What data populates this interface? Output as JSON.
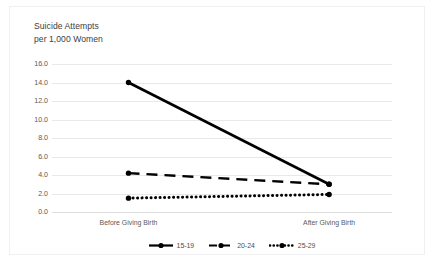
{
  "chart_data": {
    "type": "line",
    "title": "Suicide Attempts\nper 1,000 Women",
    "title_line1": "Suicide Attempts",
    "title_line2": "per 1,000 Women",
    "xlabel": "",
    "ylabel": "",
    "categories": [
      "Before Giving Birth",
      "After Giving Birth"
    ],
    "yticks": [
      "0.0",
      "2.0",
      "4.0",
      "6.0",
      "8.0",
      "10.0",
      "12.0",
      "14.0",
      "16.0"
    ],
    "ylim": [
      0.0,
      16.0
    ],
    "ytick_step": 2.0,
    "grid": true,
    "legend_position": "bottom",
    "series": [
      {
        "name": "15-19",
        "values": [
          14.0,
          3.0
        ],
        "style": "solid",
        "color": "#000000",
        "marker": "circle"
      },
      {
        "name": "20-24",
        "values": [
          4.2,
          3.0
        ],
        "style": "dashed",
        "color": "#000000",
        "marker": "circle"
      },
      {
        "name": "25-29",
        "values": [
          1.5,
          1.9
        ],
        "style": "dotted",
        "color": "#000000",
        "marker": "circle"
      }
    ]
  },
  "legend": {
    "items": [
      {
        "label": "15-19"
      },
      {
        "label": "20-24"
      },
      {
        "label": "25-29"
      }
    ]
  },
  "colors": {
    "series": "#000000",
    "gridline": "#e8e8ec",
    "axis": "#dededf",
    "tick_text": "#5a5a5a",
    "title_text": "#404040",
    "background": "#ffffff",
    "frame_border": "#f0f0f2"
  }
}
